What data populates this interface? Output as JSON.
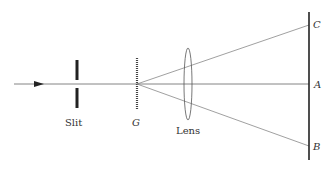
{
  "labels": {
    "slit": "Slit",
    "grating": "G",
    "lens": "Lens",
    "point_a": "A",
    "point_b": "B",
    "point_c": "C"
  },
  "colors": {
    "line": "#555555",
    "thick": "#222222",
    "text": "#333333"
  }
}
